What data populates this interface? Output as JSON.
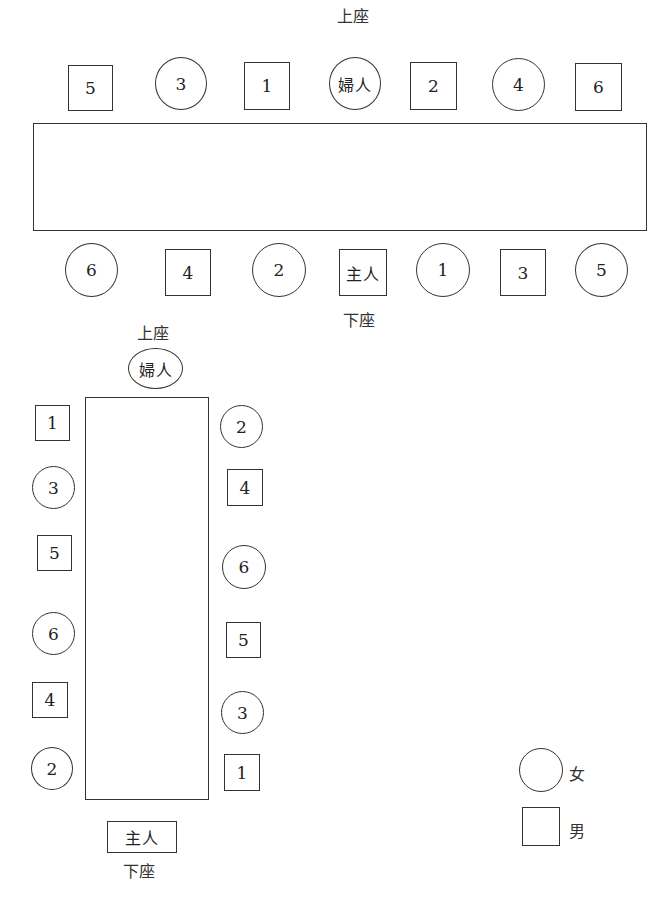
{
  "diagram": {
    "upper_seat_label": "上座",
    "lower_seat_label": "下座",
    "hostess": "婦人",
    "host": "主人"
  },
  "horizontal_table": {
    "top_label": "上座",
    "bottom_label": "下座",
    "top_row": [
      {
        "label": "5",
        "gender": "male"
      },
      {
        "label": "3",
        "gender": "female"
      },
      {
        "label": "1",
        "gender": "male"
      },
      {
        "label": "婦人",
        "gender": "female"
      },
      {
        "label": "2",
        "gender": "male"
      },
      {
        "label": "4",
        "gender": "female"
      },
      {
        "label": "6",
        "gender": "male"
      }
    ],
    "bottom_row": [
      {
        "label": "6",
        "gender": "female"
      },
      {
        "label": "4",
        "gender": "male"
      },
      {
        "label": "2",
        "gender": "female"
      },
      {
        "label": "主人",
        "gender": "male"
      },
      {
        "label": "1",
        "gender": "female"
      },
      {
        "label": "3",
        "gender": "male"
      },
      {
        "label": "5",
        "gender": "female"
      }
    ]
  },
  "vertical_table": {
    "top_label": "上座",
    "head": {
      "label": "婦人",
      "gender": "female"
    },
    "foot": {
      "label": "主人",
      "gender": "male"
    },
    "bottom_label": "下座",
    "left_column": [
      {
        "label": "1",
        "gender": "male"
      },
      {
        "label": "3",
        "gender": "female"
      },
      {
        "label": "5",
        "gender": "male"
      },
      {
        "label": "6",
        "gender": "female"
      },
      {
        "label": "4",
        "gender": "male"
      },
      {
        "label": "2",
        "gender": "female"
      }
    ],
    "right_column": [
      {
        "label": "2",
        "gender": "female"
      },
      {
        "label": "4",
        "gender": "male"
      },
      {
        "label": "6",
        "gender": "female"
      },
      {
        "label": "5",
        "gender": "male"
      },
      {
        "label": "3",
        "gender": "female"
      },
      {
        "label": "1",
        "gender": "male"
      }
    ]
  },
  "legend": [
    {
      "shape": "circle",
      "label": "女"
    },
    {
      "shape": "square",
      "label": "男"
    }
  ]
}
